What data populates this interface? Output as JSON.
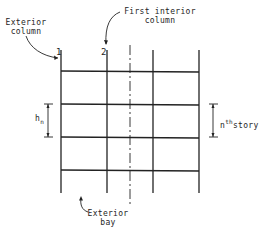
{
  "diagram": {
    "title": "",
    "labels": {
      "exterior_column": [
        "Exterior",
        "column"
      ],
      "first_interior_column": [
        "First interior",
        "column"
      ],
      "exterior_bay": [
        "Exterior",
        "bay"
      ],
      "col_1": "1",
      "col_2": "2",
      "story_height": {
        "base": "h",
        "sub": "n"
      },
      "nth_story": {
        "pre": "n",
        "sup": "th",
        "post": "story"
      }
    },
    "frame": {
      "columns_x": [
        61,
        107,
        153,
        199
      ],
      "beams_y": [
        71,
        104,
        137,
        170
      ],
      "column_top_y": 50,
      "column_bottom_y": 193,
      "centerline_x": 130
    },
    "colors": {
      "line": "#222222",
      "background": "#ffffff"
    }
  }
}
